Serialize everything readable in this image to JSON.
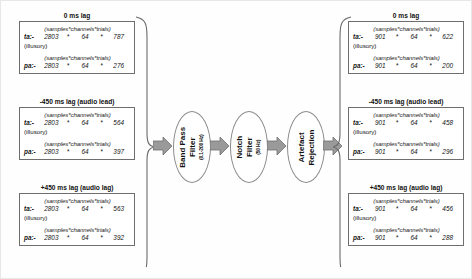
{
  "figure": {
    "header_line": "(samples*channels*trials)",
    "star": "*",
    "illusory_note": "(illusory)",
    "ta_label": "ta:-",
    "pa_label": "pa:-"
  },
  "left_column": {
    "groups": [
      {
        "title": "0 ms lag",
        "ta": {
          "label": "ta:-",
          "samples": "2803",
          "channels": "64",
          "trials": "787"
        },
        "note": "(illusory)",
        "pa": {
          "label": "pa:-",
          "samples": "2803",
          "channels": "64",
          "trials": "276"
        }
      },
      {
        "title": "-450 ms lag (audio lead)",
        "ta": {
          "label": "ta:-",
          "samples": "2803",
          "channels": "64",
          "trials": "564"
        },
        "note": "(illusory)",
        "pa": {
          "label": "pa:-",
          "samples": "2803",
          "channels": "64",
          "trials": "397"
        }
      },
      {
        "title": "+450 ms lag (audio lag)",
        "ta": {
          "label": "ta:-",
          "samples": "2803",
          "channels": "64",
          "trials": "563"
        },
        "note": "(illusory)",
        "pa": {
          "label": "pa:-",
          "samples": "2803",
          "channels": "64",
          "trials": "392"
        }
      }
    ]
  },
  "right_column": {
    "groups": [
      {
        "title": "0 ms lag",
        "ta": {
          "label": "ta:-",
          "samples": "901",
          "channels": "64",
          "trials": "622"
        },
        "note": "(illusory)",
        "pa": {
          "label": "pa:-",
          "samples": "901",
          "channels": "64",
          "trials": "200"
        }
      },
      {
        "title": "-450 ms lag (audio lead)",
        "ta": {
          "label": "ta:-",
          "samples": "901",
          "channels": "64",
          "trials": "458"
        },
        "note": "(illusory)",
        "pa": {
          "label": "pa:-",
          "samples": "901",
          "channels": "64",
          "trials": "296"
        }
      },
      {
        "title": "+450 ms lag (audio lag)",
        "ta": {
          "label": "ta:-",
          "samples": "901",
          "channels": "64",
          "trials": "456"
        },
        "note": "(illusory)",
        "pa": {
          "label": "pa:-",
          "samples": "901",
          "channels": "64",
          "trials": "288"
        }
      }
    ]
  },
  "pipeline": {
    "stages": [
      {
        "name": "band-pass-filter",
        "line1": "Band Pass",
        "line2": "Filter",
        "param": "(0.1-200 Hz)"
      },
      {
        "name": "notch-filter",
        "line1": "Notch",
        "line2": "Filter",
        "param": "(50 Hz)"
      },
      {
        "name": "artefact-rejection",
        "line1": "Artefact",
        "line2": "Rejection",
        "param": ""
      }
    ]
  },
  "colors": {
    "arrow_fill": "#9a9a9a",
    "arrow_stroke": "#6f6f6f",
    "box_border": "#6e6e6e",
    "ellipse_border": "#8a8a8a",
    "brace": "#6a6a6a",
    "text": "#111111"
  }
}
